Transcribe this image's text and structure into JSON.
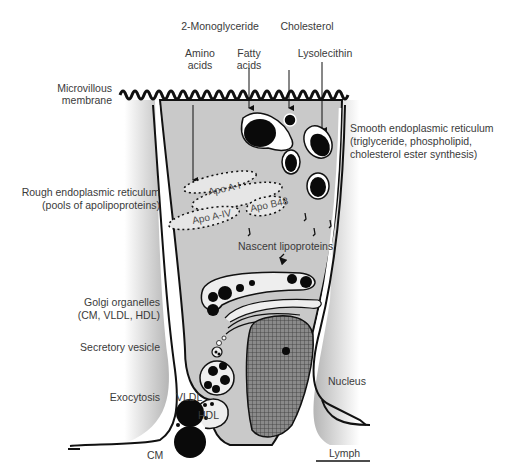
{
  "diagram": {
    "type": "cell-diagram",
    "colors": {
      "cytoplasm": "#c9c9c9",
      "outline": "#111111",
      "text": "#3a3a3a",
      "vesicle_fill": "#eeeeee",
      "lipid": "#0a0a0a"
    }
  },
  "labels": {
    "monoglyceride": "2-Monoglyceride",
    "cholesterol": "Cholesterol",
    "amino_acids_1": "Amino",
    "amino_acids_2": "acids",
    "fatty_acids_1": "Fatty",
    "fatty_acids_2": "acids",
    "lysolecithin": "Lysolecithin",
    "microvillous_1": "Microvillous",
    "microvillous_2": "membrane",
    "ser_1": "Smooth endoplasmic reticulum",
    "ser_2": "(triglyceride, phospholipid,",
    "ser_3": "cholesterol ester synthesis)",
    "rer_1": "Rough endoplasmic reticulum",
    "rer_2": "(pools of apolipoproteins)",
    "apo_a1": "Apo A-I",
    "apo_a4": "Apo A-IV",
    "apo_b48": "Apo B48",
    "nascent": "Nascent lipoproteins",
    "golgi_1": "Golgi organelles",
    "golgi_2": "(CM, VLDL, HDL)",
    "secretory": "Secretory vesicle",
    "exocytosis": "Exocytosis",
    "vldl": "VLDL",
    "hdl": "HDL",
    "cm": "CM",
    "nucleus": "Nucleus",
    "lymph": "Lymph"
  }
}
